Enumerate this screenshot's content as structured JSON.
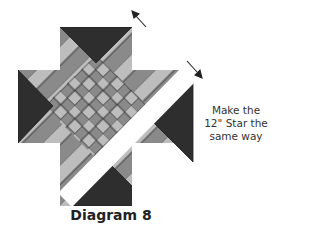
{
  "diagram": {
    "caption": "Diagram 8",
    "note": {
      "line1": "Make the",
      "line2": "12\" Star the",
      "line3": "same way"
    },
    "colors": {
      "dark": "#2e2e2e",
      "medium": "#8a8a8a",
      "light": "#bdbdbd",
      "outline": "#1e1e1e",
      "gap": "#ffffff"
    },
    "arrows": [
      {
        "direction": "up-left",
        "from": [
          146,
          27
        ],
        "to": [
          133,
          12
        ]
      },
      {
        "direction": "down-right",
        "from": [
          187,
          61
        ],
        "to": [
          201,
          77
        ]
      }
    ]
  }
}
